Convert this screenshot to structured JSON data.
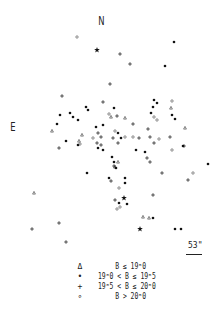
{
  "figure": {
    "north_label": "N",
    "east_label": "E",
    "scale_label": "53\"",
    "legend": [
      {
        "symbol": "triangle",
        "glyph": "Δ",
        "label": "B ≤ 19ᵐ0"
      },
      {
        "symbol": "filled-dot",
        "glyph": "•",
        "label": "19ᵐ0 < B ≤ 19ᵐ5"
      },
      {
        "symbol": "plus",
        "glyph": "+",
        "label": "19ᵐ5 < B ≤ 20ᵐ0"
      },
      {
        "symbol": "open-circle",
        "glyph": "∘",
        "label": "B > 20ᵐ0"
      }
    ]
  },
  "chart_data": {
    "type": "scatter",
    "title": "",
    "xlabel": "",
    "ylabel": "",
    "grid": false,
    "legend_position": "bottom",
    "series": [
      {
        "name": "triangle",
        "points": [
          [
            34,
            193
          ],
          [
            52,
            131
          ],
          [
            111,
            117
          ],
          [
            125,
            118
          ],
          [
            171,
            108
          ],
          [
            185,
            128
          ],
          [
            143,
            217
          ],
          [
            149,
            218
          ],
          [
            118,
            162
          ],
          [
            115,
            167
          ],
          [
            82,
            135
          ],
          [
            79,
            141
          ]
        ]
      },
      {
        "name": "dot",
        "points": [
          [
            174,
            42
          ],
          [
            165,
            66
          ],
          [
            114,
            108
          ],
          [
            70,
            113
          ],
          [
            73,
            117
          ],
          [
            78,
            120
          ],
          [
            57,
            124
          ],
          [
            86,
            107
          ],
          [
            88,
            110
          ],
          [
            103,
            125
          ],
          [
            96,
            127
          ],
          [
            78,
            145
          ],
          [
            66,
            141
          ],
          [
            98,
            148
          ],
          [
            103,
            150
          ],
          [
            112,
            157
          ],
          [
            114,
            162
          ],
          [
            116,
            168
          ],
          [
            87,
            173
          ],
          [
            125,
            183
          ],
          [
            127,
            204
          ],
          [
            119,
            203
          ],
          [
            109,
            178
          ],
          [
            125,
            178
          ],
          [
            136,
            150
          ],
          [
            145,
            152
          ],
          [
            151,
            113
          ],
          [
            153,
            107
          ],
          [
            172,
            115
          ],
          [
            175,
            119
          ],
          [
            183,
            146
          ],
          [
            118,
            133
          ],
          [
            121,
            138
          ],
          [
            208,
            164
          ],
          [
            175,
            229
          ],
          [
            181,
            229
          ],
          [
            153,
            218
          ],
          [
            60,
            115
          ],
          [
            154,
            100
          ],
          [
            157,
            103
          ]
        ]
      },
      {
        "name": "plus",
        "points": [
          [
            120,
            54
          ],
          [
            130,
            64
          ],
          [
            110,
            84
          ],
          [
            62,
            96
          ],
          [
            103,
            102
          ],
          [
            117,
            116
          ],
          [
            133,
            124
          ],
          [
            98,
            133
          ],
          [
            101,
            137
          ],
          [
            59,
            148
          ],
          [
            97,
            143
          ],
          [
            101,
            145
          ],
          [
            113,
            138
          ],
          [
            118,
            143
          ],
          [
            139,
            138
          ],
          [
            148,
            129
          ],
          [
            150,
            137
          ],
          [
            154,
            143
          ],
          [
            147,
            158
          ],
          [
            150,
            162
          ],
          [
            170,
            137
          ],
          [
            184,
            146
          ],
          [
            162,
            173
          ],
          [
            111,
            181
          ],
          [
            115,
            200
          ],
          [
            153,
            195
          ],
          [
            188,
            180
          ],
          [
            32,
            229
          ],
          [
            59,
            223
          ],
          [
            66,
            242
          ],
          [
            114,
            166
          ]
        ]
      },
      {
        "name": "circle",
        "points": [
          [
            77,
            37
          ],
          [
            172,
            101
          ],
          [
            154,
            117
          ],
          [
            157,
            120
          ],
          [
            115,
            131
          ],
          [
            125,
            137
          ],
          [
            133,
            137
          ],
          [
            93,
            138
          ],
          [
            109,
            114
          ],
          [
            159,
            139
          ],
          [
            172,
            150
          ],
          [
            193,
            173
          ],
          [
            119,
            188
          ],
          [
            117,
            209
          ],
          [
            120,
            207
          ],
          [
            80,
            144
          ]
        ]
      },
      {
        "name": "star",
        "points": [
          [
            97,
            50
          ],
          [
            124,
            198
          ],
          [
            140,
            229
          ]
        ]
      }
    ]
  }
}
